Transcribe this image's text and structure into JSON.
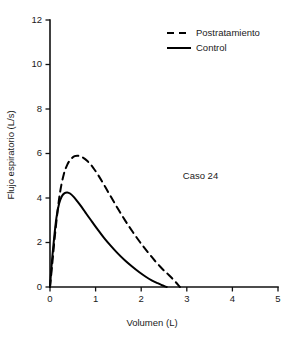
{
  "chart_data": {
    "type": "line",
    "title": "",
    "xlabel": "Volumen (L)",
    "ylabel": "Flujo espiratorio (L/s)",
    "xlim": [
      0,
      5
    ],
    "ylim": [
      0,
      12
    ],
    "xticks": [
      0,
      1,
      2,
      3,
      4,
      5
    ],
    "yticks": [
      0,
      2,
      4,
      6,
      8,
      10,
      12
    ],
    "xtick_labels": [
      "0",
      "1",
      "2",
      "3",
      "4",
      "5"
    ],
    "ytick_labels": [
      "0",
      "2",
      "4",
      "6",
      "8",
      "10",
      "12"
    ],
    "grid": false,
    "legend_position": "top-right",
    "annotations": [
      {
        "text": "Caso 24",
        "x": 3.3,
        "y": 4.85
      }
    ],
    "series": [
      {
        "name": "Postratamiento",
        "style": "dashed",
        "color": "#000000",
        "x": [
          0.0,
          0.05,
          0.1,
          0.16,
          0.22,
          0.3,
          0.38,
          0.46,
          0.54,
          0.62,
          0.72,
          0.82,
          0.94,
          1.06,
          1.2,
          1.34,
          1.5,
          1.66,
          1.82,
          1.98,
          2.14,
          2.3,
          2.46,
          2.6,
          2.72,
          2.8,
          2.85
        ],
        "y": [
          0.0,
          1.05,
          2.15,
          3.3,
          4.25,
          5.05,
          5.5,
          5.75,
          5.88,
          5.9,
          5.82,
          5.66,
          5.38,
          5.02,
          4.54,
          4.04,
          3.48,
          2.95,
          2.46,
          2.0,
          1.58,
          1.18,
          0.82,
          0.55,
          0.3,
          0.12,
          0.0
        ]
      },
      {
        "name": "Control",
        "style": "solid",
        "color": "#000000",
        "x": [
          0.0,
          0.04,
          0.09,
          0.14,
          0.2,
          0.26,
          0.32,
          0.38,
          0.44,
          0.52,
          0.6,
          0.7,
          0.8,
          0.92,
          1.04,
          1.18,
          1.32,
          1.48,
          1.64,
          1.8,
          1.96,
          2.1,
          2.24,
          2.36,
          2.46,
          2.52,
          2.56
        ],
        "y": [
          0.0,
          1.1,
          2.2,
          3.1,
          3.75,
          4.08,
          4.22,
          4.25,
          4.2,
          4.05,
          3.85,
          3.58,
          3.28,
          2.94,
          2.6,
          2.22,
          1.88,
          1.52,
          1.2,
          0.92,
          0.66,
          0.46,
          0.29,
          0.17,
          0.08,
          0.03,
          0.0
        ]
      }
    ]
  },
  "legend": {
    "items": [
      {
        "label": "Postratamiento",
        "style": "dashed"
      },
      {
        "label": "Control",
        "style": "solid"
      }
    ]
  }
}
